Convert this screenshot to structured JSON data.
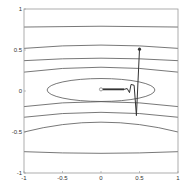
{
  "chart_data": {
    "type": "contour",
    "title": "",
    "xlabel": "",
    "ylabel": "",
    "xlim": [
      -1,
      1
    ],
    "ylim": [
      -1,
      1
    ],
    "grid": false,
    "legend": null,
    "x_ticks": [
      -1,
      -0.5,
      0,
      0.5,
      1
    ],
    "x_tick_labels": [
      "-1",
      "-0.5",
      "0",
      "0.5",
      "1"
    ],
    "y_ticks": [
      -1,
      -0.5,
      0,
      0.5,
      1
    ],
    "y_tick_labels": [
      "-1",
      "-0.5",
      "0",
      "0.5",
      "1"
    ],
    "contours": {
      "description": "Level sets of an elongated quadratic bowl centered at (0,0), much steeper in y than in x",
      "inner_ellipse": {
        "center": [
          0,
          0
        ],
        "x_half_width": 0.7,
        "y_half_height": 0.14
      },
      "outer_levels_y_at_center": [
        0.79,
        0.56,
        0.4,
        0.29,
        -0.13,
        -0.26,
        -0.38,
        -0.54,
        -0.76
      ],
      "outer_levels_y_at_edges": [
        0.78,
        0.52,
        0.37,
        0.23,
        -0.19,
        -0.32,
        -0.5,
        -0.74
      ]
    },
    "trajectory": {
      "start_marker": "filled-dot",
      "end_marker": "open-circle",
      "points": [
        [
          0.5,
          0.51
        ],
        [
          0.46,
          -0.3
        ],
        [
          0.43,
          0.07
        ],
        [
          0.39,
          0.08
        ],
        [
          0.37,
          -0.02
        ],
        [
          0.34,
          0.03
        ],
        [
          0.3,
          0.02
        ],
        [
          0.2,
          0.02
        ],
        [
          0.1,
          0.02
        ],
        [
          0.03,
          0.02
        ],
        [
          0.0,
          0.02
        ]
      ]
    },
    "colors": {
      "lines": "#444444",
      "axes": "#888888",
      "background": "#ffffff"
    }
  }
}
